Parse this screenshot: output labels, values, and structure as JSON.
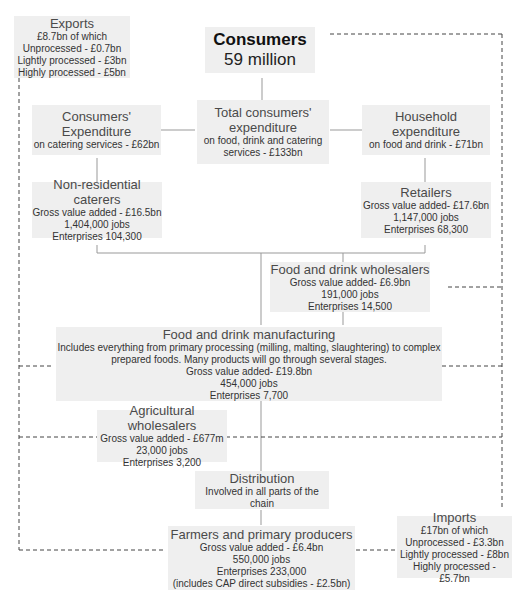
{
  "colors": {
    "box_bg": "#efefef",
    "solid_line": "#999999",
    "dashed_line": "#444444"
  },
  "nodes": {
    "exports": {
      "title": "Exports",
      "lines": [
        "£8.7bn of which",
        "Unprocessed - £0.7bn",
        "Lightly processed - £3bn",
        "Highly processed - £5bn"
      ]
    },
    "consumers": {
      "title": "Consumers",
      "lines": [
        "59 million"
      ]
    },
    "consumers_expenditure": {
      "title": "Consumers' Expenditure",
      "lines": [
        "on catering services - £62bn"
      ]
    },
    "total_expenditure": {
      "title": "Total consumers' expenditure",
      "lines": [
        "on food, drink and catering services - £133bn"
      ]
    },
    "household_expenditure": {
      "title": "Household expenditure",
      "lines": [
        "on food and  drink - £71bn"
      ]
    },
    "non_residential_caterers": {
      "title": "Non-residential caterers",
      "lines": [
        "Gross value added - £16.5bn",
        "1,404,000 jobs",
        "Enterprises 104,300"
      ]
    },
    "retailers": {
      "title": "Retailers",
      "lines": [
        "Gross value added- £17.6bn",
        "1,147,000 jobs",
        "Enterprises 68,300"
      ]
    },
    "food_drink_wholesalers": {
      "title": "Food and drink wholesalers",
      "lines": [
        "Gross value added- £6.9bn",
        "191,000 jobs",
        "Enterprises 14,500"
      ]
    },
    "food_drink_manufacturing": {
      "title": "Food and drink manufacturing",
      "lines": [
        "Includes everything from primary processing (milling, malting, slaughtering) to complex",
        "prepared foods. Many products will go through several stages.",
        "Gross value added- £19.8bn",
        "454,000 jobs",
        "Enterprises 7,700"
      ]
    },
    "agricultural_wholesalers": {
      "title": "Agricultural wholesalers",
      "lines": [
        "Gross value added - £677m",
        "23,000 jobs",
        "Enterprises 3,200"
      ]
    },
    "distribution": {
      "title": "Distribution",
      "lines": [
        "Involved in all parts of the chain"
      ]
    },
    "farmers": {
      "title": "Farmers and primary producers",
      "lines": [
        "Gross value added - £6.4bn",
        "550,000 jobs",
        "Enterprises 233,000",
        "(includes CAP direct subsidies - £2.5bn)"
      ]
    },
    "imports": {
      "title": "Imports",
      "lines": [
        "£17bn of which",
        "Unprocessed - £3.3bn",
        "Lightly processed - £8bn",
        "Highly processed - £5.7bn"
      ]
    }
  }
}
